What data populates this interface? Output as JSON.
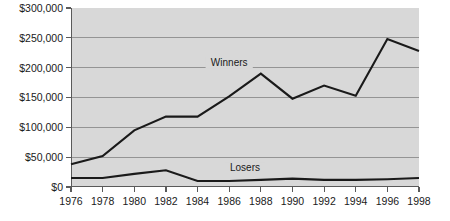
{
  "chart_data": {
    "type": "line",
    "title": "",
    "subtitle": "",
    "xlabel": "",
    "ylabel": "",
    "x": [
      1976,
      1978,
      1980,
      1982,
      1984,
      1986,
      1988,
      1990,
      1992,
      1994,
      1996,
      1998
    ],
    "xtick_labels": [
      "1976",
      "1978",
      "1980",
      "1982",
      "1984",
      "1986",
      "1988",
      "1990",
      "1992",
      "1994",
      "1996",
      "1998"
    ],
    "xlim": [
      1976,
      1998
    ],
    "ylim": [
      0,
      300000
    ],
    "ytick_values": [
      0,
      50000,
      100000,
      150000,
      200000,
      250000,
      300000
    ],
    "ytick_labels": [
      "$0",
      "$50,000",
      "$100,000",
      "$150,000",
      "$200,000",
      "$250,000",
      "$300,000"
    ],
    "grid": true,
    "legend_position": "inline-annotation",
    "series": [
      {
        "name": "Winners",
        "label_x": 1986,
        "label_y": 205000,
        "color": "#1a1a1a",
        "values": [
          38000,
          52000,
          95000,
          118000,
          118000,
          152000,
          190000,
          148000,
          170000,
          153000,
          248000,
          228000
        ]
      },
      {
        "name": "Losers",
        "label_x": 1987,
        "label_y": 28000,
        "color": "#1a1a1a",
        "values": [
          15000,
          15000,
          22000,
          28000,
          10000,
          10000,
          12000,
          14000,
          12000,
          12000,
          13000,
          15000
        ]
      }
    ],
    "annotations": [
      {
        "text": "Winners",
        "x": 1986,
        "y": 205000
      },
      {
        "text": "Losers",
        "x": 1987,
        "y": 28000
      }
    ],
    "colors": {
      "plot_background": "#d8d8d8",
      "page_background": "#ffffff",
      "gridline": "#8d8d8d",
      "axis": "#5a5a5a",
      "line": "#1a1a1a",
      "text": "#1a1a1a"
    }
  }
}
